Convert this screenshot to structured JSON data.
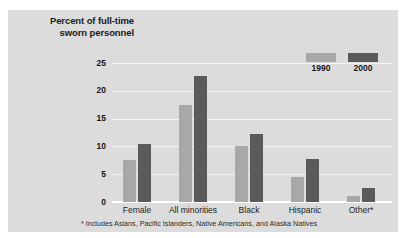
{
  "figure": {
    "title_lines": [
      "Percent of full-time",
      "sworn personnel"
    ],
    "footnote": "* Includes Asians, Pacific Islanders, Native Americans, and Alaska Natives",
    "panel_color": "#dcdcdc",
    "background_color": "#ffffff"
  },
  "legend": {
    "position": "top-right",
    "entries": [
      {
        "label": "1990",
        "color": "#a8a8a8"
      },
      {
        "label": "2000",
        "color": "#5a5a5a"
      }
    ]
  },
  "chart_data": {
    "type": "bar",
    "title": "Percent of full-time sworn personnel",
    "xlabel": "",
    "ylabel": "Percent of full-time sworn personnel",
    "categories": [
      "Female",
      "All minorities",
      "Black",
      "Hispanic",
      "Other*"
    ],
    "series": [
      {
        "name": "1990",
        "color": "#a8a8a8",
        "values": [
          7.5,
          17.5,
          10.0,
          4.5,
          1.1
        ]
      },
      {
        "name": "2000",
        "color": "#5a5a5a",
        "values": [
          10.5,
          22.7,
          12.2,
          7.8,
          2.6
        ]
      }
    ],
    "yticks": [
      0,
      5,
      10,
      15,
      20,
      25
    ],
    "ytick_labels": [
      "0",
      "5",
      "10",
      "15",
      "20",
      "25"
    ],
    "ylim": [
      0,
      27
    ],
    "grid": true,
    "legend_position": "top-right",
    "annotations": [
      "* Includes Asians, Pacific Islanders, Native Americans, and Alaska Natives"
    ]
  }
}
